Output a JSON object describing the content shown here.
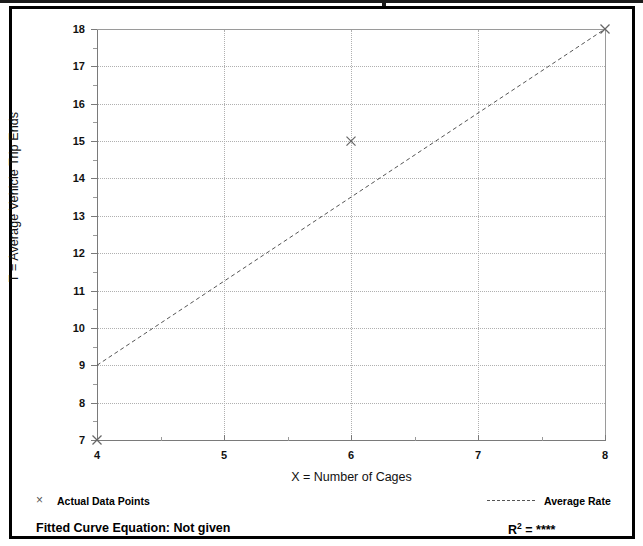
{
  "chart_data": {
    "type": "scatter",
    "title": "",
    "xlabel": "X = Number of Cages",
    "ylabel": "T = Average Vehicle Trip Ends",
    "xlim": [
      4,
      8
    ],
    "ylim": [
      7,
      18
    ],
    "xticks": [
      "4",
      "5",
      "6",
      "7",
      "8"
    ],
    "yticks": [
      "7",
      "8",
      "9",
      "10",
      "11",
      "12",
      "13",
      "14",
      "15",
      "16",
      "17",
      "18"
    ],
    "grid": "dotted major gridlines on both axes",
    "legend_position": "below plot",
    "series": [
      {
        "name": "Actual Data Points",
        "marker": "x",
        "points": [
          {
            "x": 4,
            "y": 7
          },
          {
            "x": 6,
            "y": 15
          },
          {
            "x": 8,
            "y": 18
          }
        ]
      },
      {
        "name": "Average Rate",
        "style": "dashed line",
        "points": [
          {
            "x": 4,
            "y": 9
          },
          {
            "x": 8,
            "y": 18
          }
        ]
      }
    ],
    "annotations": {
      "fitted_curve_equation": "Fitted Curve Equation:  Not given",
      "r_squared": "****"
    },
    "colors": {
      "axis": "#7a7a7a",
      "gridline": "#b0b0b0",
      "marker": "#666666",
      "trendline": "#555555",
      "frame": "#000000",
      "text": "#000000"
    }
  },
  "axes": {
    "y_title": "T = Average Vehicle Trip Ends",
    "x_title": "X = Number of Cages",
    "y_ticks": [
      "18",
      "17",
      "16",
      "15",
      "14",
      "13",
      "12",
      "11",
      "10",
      "9",
      "8",
      "7"
    ],
    "x_ticks": [
      "4",
      "5",
      "6",
      "7",
      "8"
    ]
  },
  "legend": {
    "data_points_marker": "×",
    "data_points_label": "Actual Data Points",
    "average_rate_label": "Average Rate"
  },
  "footer": {
    "equation_label": "Fitted Curve Equation:  Not given",
    "r_prefix": "R",
    "r_exponent": "2",
    "r_equals": " = ",
    "r_value": "****"
  }
}
